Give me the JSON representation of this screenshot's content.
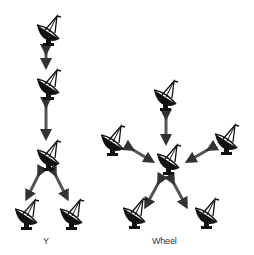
{
  "diagrams": [
    {
      "name": "Y",
      "label": "Y"
    },
    {
      "name": "Wheel",
      "label": "Wheel"
    }
  ],
  "colors": {
    "dish": "#111111",
    "arrow_dark": "#222222",
    "arrow_light": "#999999"
  }
}
